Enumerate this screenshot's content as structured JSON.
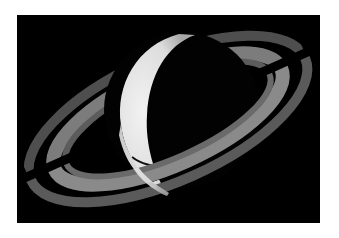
{
  "image": {
    "subject": "Saturn with rings, crescent phase",
    "alt": "Photograph of Saturn showing a bright crescent and its ring system against black space"
  },
  "colors": {
    "background": "#ffffff",
    "space": "#000000",
    "planet_lit": "#e8e8e8",
    "ring_outer": "#5a5a5a",
    "ring_inner": "#8c8c8c"
  }
}
